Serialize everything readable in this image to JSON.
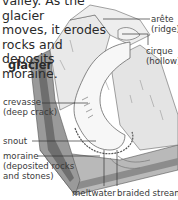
{
  "intro_text": "valley. As the glacier moves, it erodes rocks and deposits moraine.",
  "intro_lines": [
    "valley. As the glacier",
    "moves, it erodes",
    "rocks and",
    "deposits",
    "moraine."
  ],
  "title": "glacier",
  "labels": {
    "arete": {
      "line1": "arête",
      "line2": "(ridge)"
    },
    "cirque": {
      "line1": "cirque",
      "line2": "(hollow)"
    },
    "crevasse": {
      "line1": "crevasse",
      "line2": "(deep crack)"
    },
    "snout": {
      "line1": "snout"
    },
    "moraine": {
      "line1": "moraine",
      "line2": "(deposited rocks",
      "line3": "and stones)"
    },
    "meltwater": {
      "line1": "meltwater"
    },
    "braided_stream": {
      "line1": "braided stream"
    }
  },
  "colors": {
    "ice": "#f4f4f4",
    "rock_light": "#e6e6e6",
    "rock_mid": "#bdbdbd",
    "rock_dark": "#8a8a8a",
    "leader_line": "#333333",
    "text": "#3a3a3a"
  }
}
